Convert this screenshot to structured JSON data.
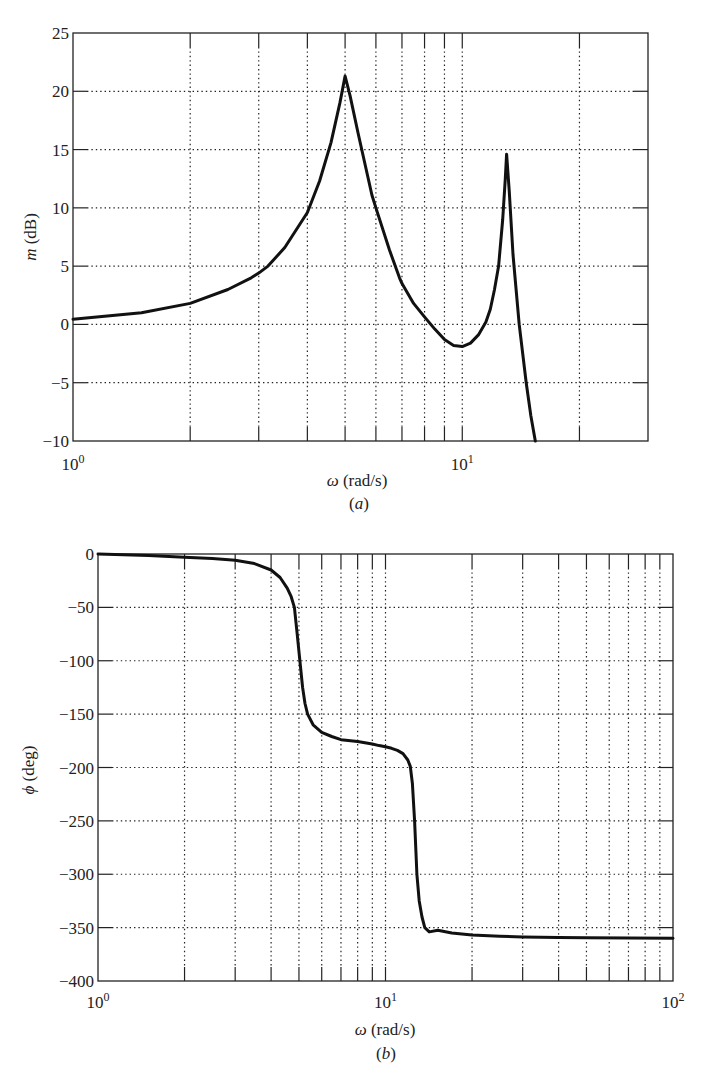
{
  "chart_data": [
    {
      "id": "a",
      "type": "line",
      "title": "",
      "panel_label": "(a)",
      "xlabel": "ω (rad/s)",
      "ylabel": "m (dB)",
      "xscale": "log",
      "xlim": [
        1,
        30
      ],
      "ylim": [
        -10,
        25
      ],
      "grid": true,
      "y_ticks": [
        -10,
        -5,
        0,
        5,
        10,
        15,
        20,
        25
      ],
      "y_tick_labels": [
        "−10",
        "−5",
        "0",
        "5",
        "10",
        "15",
        "20",
        "25"
      ],
      "x_major_ticks": [
        1,
        10
      ],
      "x_major_tick_labels": [
        {
          "base": "10",
          "exp": "0"
        },
        {
          "base": "10",
          "exp": "1"
        }
      ],
      "x_minor_ticks": [
        2,
        3,
        4,
        5,
        6,
        7,
        8,
        9,
        20
      ],
      "series": [
        {
          "name": "magnitude",
          "x": [
            1,
            1.5,
            2,
            2.5,
            2.87,
            3,
            3.17,
            3.5,
            4,
            4.3,
            4.6,
            4.85,
            5.0,
            5.15,
            5.4,
            5.86,
            6,
            6.5,
            6.9,
            7,
            7.5,
            8,
            8.5,
            9,
            9.5,
            10,
            10.5,
            11,
            11.5,
            11.8,
            12.1,
            12.4,
            12.7,
            12.9,
            13.0,
            13.2,
            13.5,
            14,
            14.6,
            15.0,
            15.4
          ],
          "y": [
            0.45,
            1.0,
            1.8,
            3.0,
            4.0,
            4.4,
            5.0,
            6.6,
            9.6,
            12.3,
            15.6,
            19.0,
            21.3,
            19.6,
            16.4,
            11.1,
            10.0,
            6.4,
            4.0,
            3.5,
            1.8,
            0.65,
            -0.4,
            -1.3,
            -1.8,
            -1.9,
            -1.6,
            -0.9,
            0.2,
            1.3,
            3.0,
            5.0,
            9.0,
            12.5,
            14.6,
            11.5,
            6.0,
            0.0,
            -5.0,
            -7.8,
            -10.0
          ]
        }
      ]
    },
    {
      "id": "b",
      "type": "line",
      "title": "",
      "panel_label": "(b)",
      "xlabel": "ω (rad/s)",
      "ylabel": "ϕ (deg)",
      "xscale": "log",
      "xlim": [
        1,
        100
      ],
      "ylim": [
        -400,
        0
      ],
      "grid": true,
      "y_ticks": [
        -400,
        -350,
        -300,
        -250,
        -200,
        -150,
        -100,
        -50,
        0
      ],
      "y_tick_labels": [
        "−400",
        "−350",
        "−300",
        "−250",
        "−200",
        "−150",
        "−100",
        "−50",
        "0"
      ],
      "x_major_ticks": [
        1,
        10,
        100
      ],
      "x_major_tick_labels": [
        {
          "base": "10",
          "exp": "0"
        },
        {
          "base": "10",
          "exp": "1"
        },
        {
          "base": "10",
          "exp": "2"
        }
      ],
      "x_minor_ticks": [
        2,
        3,
        4,
        5,
        6,
        7,
        8,
        9,
        20,
        30,
        40,
        50,
        60,
        70,
        80,
        90
      ],
      "series": [
        {
          "name": "phase",
          "x": [
            1,
            1.5,
            2,
            2.5,
            3,
            3.5,
            4,
            4.3,
            4.55,
            4.7,
            4.82,
            4.93,
            5.04,
            5.15,
            5.25,
            5.36,
            5.6,
            6,
            6.5,
            7,
            8,
            9,
            9.5,
            10,
            10.5,
            11,
            11.5,
            11.96,
            12.2,
            12.4,
            12.62,
            12.86,
            13.1,
            13.4,
            13.7,
            14.2,
            15.2,
            17,
            20,
            25,
            30,
            40,
            50,
            70,
            100
          ],
          "y": [
            0,
            -1.5,
            -3,
            -4.3,
            -5.8,
            -9,
            -15,
            -22,
            -32,
            -40,
            -50,
            -75,
            -100,
            -125,
            -140,
            -150,
            -160,
            -167,
            -171,
            -174,
            -175.6,
            -178,
            -179.5,
            -180.5,
            -182,
            -184,
            -187,
            -193,
            -199,
            -215,
            -250,
            -300,
            -325,
            -340,
            -350,
            -354,
            -352.5,
            -355,
            -357,
            -358,
            -358.7,
            -359.2,
            -359.5,
            -359.8,
            -360
          ]
        }
      ]
    }
  ]
}
